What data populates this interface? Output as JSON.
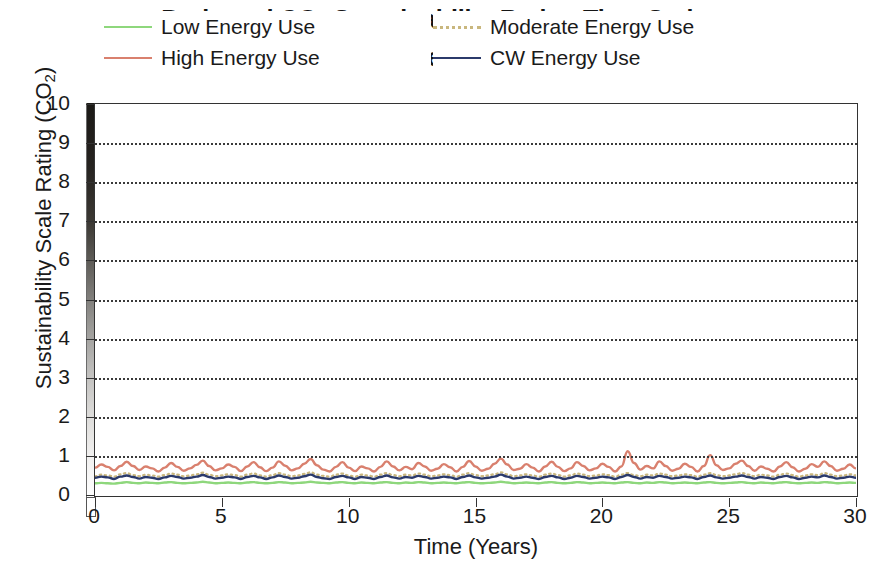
{
  "chart_data": {
    "type": "line",
    "title": "Projected CO2 Sustainability Rating Time Series",
    "title_line1_pre": "Projected CO",
    "title_line1_sub": "2",
    "title_line1_post": " Sustainability Rating Time Series",
    "subtitle": "(Behavioural Effect of Energy Use)",
    "xlabel": "Time (Years)",
    "ylabel_pre": "Sustainability Scale Rating (CO",
    "ylabel_sub": "2",
    "ylabel_post": ")",
    "ylabel": "Sustainability Scale Rating (CO2)",
    "xlim": [
      0,
      30
    ],
    "ylim": [
      0,
      10
    ],
    "xticks": [
      "0",
      "5",
      "10",
      "15",
      "20",
      "25",
      "30"
    ],
    "xtick_values": [
      0,
      5,
      10,
      15,
      20,
      25,
      30
    ],
    "yticks": [
      "0",
      "1",
      "2",
      "3",
      "4",
      "5",
      "6",
      "7",
      "8",
      "9",
      "10"
    ],
    "ytick_values": [
      0,
      1,
      2,
      3,
      4,
      5,
      6,
      7,
      8,
      9,
      10
    ],
    "grid": "horizontal dotted gridlines at every integer y value",
    "legend_position": "top-inside, two columns",
    "axis_gradient_bar": {
      "description": "vertical greyscale strip alongside the y axis",
      "top_color": "#1c1a17",
      "bottom_color": "#ffffff"
    },
    "series": [
      {
        "name": "Low Energy Use",
        "color": "#8ed77c",
        "style": "solid",
        "values": [
          0.3,
          0.31,
          0.3,
          0.29,
          0.31,
          0.33,
          0.31,
          0.3,
          0.32,
          0.31,
          0.3,
          0.32,
          0.33,
          0.31,
          0.3,
          0.31,
          0.32,
          0.34,
          0.32,
          0.3,
          0.31,
          0.32,
          0.31,
          0.3,
          0.32,
          0.33,
          0.31,
          0.3,
          0.31,
          0.33,
          0.32,
          0.3,
          0.31,
          0.32,
          0.34,
          0.32,
          0.31,
          0.3,
          0.32,
          0.33,
          0.31,
          0.3,
          0.32,
          0.31,
          0.3,
          0.32,
          0.33,
          0.31,
          0.3,
          0.32,
          0.31,
          0.33,
          0.32,
          0.3,
          0.31,
          0.32,
          0.31,
          0.3,
          0.32,
          0.33,
          0.31,
          0.3,
          0.31,
          0.32,
          0.34,
          0.32,
          0.3,
          0.31,
          0.32,
          0.31,
          0.3,
          0.32,
          0.33,
          0.31,
          0.3,
          0.31,
          0.33,
          0.32,
          0.3,
          0.31,
          0.32,
          0.31,
          0.3,
          0.32,
          0.33,
          0.31,
          0.3,
          0.32,
          0.31,
          0.33,
          0.32,
          0.3,
          0.31,
          0.32,
          0.31,
          0.3,
          0.32,
          0.33,
          0.31,
          0.3,
          0.31,
          0.32,
          0.33,
          0.31,
          0.3,
          0.32,
          0.31,
          0.3,
          0.32,
          0.33,
          0.31,
          0.3,
          0.31,
          0.32,
          0.31,
          0.33,
          0.32,
          0.3,
          0.31,
          0.32,
          0.31
        ]
      },
      {
        "name": "Moderate Energy Use",
        "color": "#c9b77e",
        "style": "dotted",
        "values": [
          0.48,
          0.52,
          0.5,
          0.47,
          0.53,
          0.56,
          0.51,
          0.48,
          0.52,
          0.5,
          0.47,
          0.51,
          0.55,
          0.52,
          0.48,
          0.5,
          0.53,
          0.57,
          0.52,
          0.48,
          0.5,
          0.53,
          0.51,
          0.47,
          0.52,
          0.55,
          0.5,
          0.47,
          0.51,
          0.56,
          0.52,
          0.48,
          0.5,
          0.54,
          0.58,
          0.52,
          0.49,
          0.47,
          0.52,
          0.55,
          0.5,
          0.47,
          0.52,
          0.5,
          0.47,
          0.52,
          0.56,
          0.51,
          0.48,
          0.52,
          0.5,
          0.55,
          0.52,
          0.48,
          0.5,
          0.53,
          0.51,
          0.47,
          0.52,
          0.56,
          0.51,
          0.48,
          0.5,
          0.53,
          0.58,
          0.53,
          0.48,
          0.5,
          0.53,
          0.5,
          0.47,
          0.52,
          0.55,
          0.51,
          0.47,
          0.5,
          0.55,
          0.52,
          0.48,
          0.5,
          0.53,
          0.51,
          0.47,
          0.52,
          0.56,
          0.51,
          0.48,
          0.52,
          0.5,
          0.55,
          0.52,
          0.48,
          0.5,
          0.53,
          0.51,
          0.47,
          0.52,
          0.56,
          0.51,
          0.48,
          0.5,
          0.53,
          0.56,
          0.52,
          0.48,
          0.52,
          0.5,
          0.47,
          0.52,
          0.55,
          0.51,
          0.47,
          0.5,
          0.53,
          0.51,
          0.56,
          0.52,
          0.48,
          0.5,
          0.53,
          0.5
        ]
      },
      {
        "name": "High Energy Use",
        "color": "#d9806e",
        "style": "solid",
        "values": [
          0.7,
          0.78,
          0.72,
          0.63,
          0.74,
          0.85,
          0.74,
          0.64,
          0.73,
          0.68,
          0.6,
          0.7,
          0.82,
          0.72,
          0.62,
          0.68,
          0.77,
          0.88,
          0.74,
          0.63,
          0.68,
          0.78,
          0.72,
          0.61,
          0.73,
          0.84,
          0.71,
          0.61,
          0.7,
          0.86,
          0.75,
          0.63,
          0.68,
          0.8,
          0.92,
          0.76,
          0.65,
          0.6,
          0.72,
          0.84,
          0.7,
          0.61,
          0.73,
          0.68,
          0.6,
          0.72,
          0.86,
          0.73,
          0.63,
          0.72,
          0.66,
          0.82,
          0.73,
          0.62,
          0.67,
          0.79,
          0.71,
          0.6,
          0.72,
          0.87,
          0.73,
          0.62,
          0.67,
          0.8,
          0.93,
          0.78,
          0.64,
          0.67,
          0.79,
          0.7,
          0.6,
          0.73,
          0.85,
          0.72,
          0.61,
          0.68,
          0.84,
          0.74,
          0.63,
          0.68,
          0.8,
          0.72,
          0.6,
          0.73,
          1.12,
          0.82,
          0.65,
          0.74,
          0.68,
          0.86,
          0.74,
          0.62,
          0.67,
          0.8,
          0.72,
          0.6,
          0.74,
          1.02,
          0.76,
          0.64,
          0.68,
          0.8,
          0.88,
          0.74,
          0.62,
          0.73,
          0.67,
          0.6,
          0.73,
          0.84,
          0.71,
          0.6,
          0.67,
          0.79,
          0.72,
          0.86,
          0.74,
          0.62,
          0.67,
          0.78,
          0.68
        ]
      },
      {
        "name": "CW Energy Use",
        "color": "#2b3a6b",
        "style": "solid",
        "values": [
          0.44,
          0.47,
          0.45,
          0.41,
          0.47,
          0.5,
          0.46,
          0.42,
          0.46,
          0.44,
          0.41,
          0.45,
          0.49,
          0.46,
          0.42,
          0.44,
          0.47,
          0.51,
          0.46,
          0.42,
          0.44,
          0.47,
          0.45,
          0.41,
          0.46,
          0.49,
          0.45,
          0.41,
          0.45,
          0.5,
          0.46,
          0.42,
          0.44,
          0.48,
          0.52,
          0.46,
          0.43,
          0.41,
          0.46,
          0.49,
          0.45,
          0.41,
          0.46,
          0.44,
          0.41,
          0.46,
          0.5,
          0.45,
          0.42,
          0.46,
          0.44,
          0.49,
          0.46,
          0.42,
          0.44,
          0.47,
          0.45,
          0.41,
          0.46,
          0.5,
          0.45,
          0.42,
          0.44,
          0.47,
          0.52,
          0.47,
          0.42,
          0.44,
          0.47,
          0.44,
          0.41,
          0.46,
          0.49,
          0.45,
          0.41,
          0.44,
          0.49,
          0.46,
          0.42,
          0.44,
          0.47,
          0.45,
          0.41,
          0.46,
          0.51,
          0.46,
          0.42,
          0.46,
          0.44,
          0.49,
          0.46,
          0.42,
          0.44,
          0.47,
          0.45,
          0.41,
          0.46,
          0.5,
          0.45,
          0.42,
          0.44,
          0.47,
          0.5,
          0.46,
          0.42,
          0.46,
          0.44,
          0.41,
          0.46,
          0.49,
          0.45,
          0.41,
          0.44,
          0.47,
          0.45,
          0.5,
          0.46,
          0.42,
          0.44,
          0.47,
          0.44
        ]
      }
    ]
  },
  "legend": {
    "items": [
      {
        "label": "Low Energy Use",
        "color": "#8ed77c",
        "style": "solid"
      },
      {
        "label": "Moderate Energy Use",
        "color": "#c9b77e",
        "style": "dotted"
      },
      {
        "label": "High Energy Use",
        "color": "#d9806e",
        "style": "solid"
      },
      {
        "label": "CW Energy Use",
        "color": "#2b3a6b",
        "style": "solid"
      }
    ]
  }
}
